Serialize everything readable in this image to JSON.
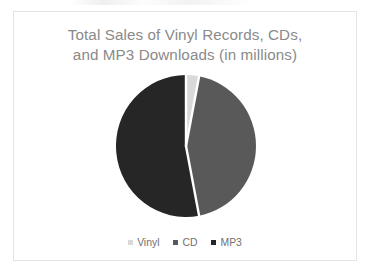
{
  "chart_data": {
    "type": "pie",
    "title": "Total Sales of Vinyl Records, CDs, and MP3 Downloads (in millions)",
    "title_lines": [
      "Total Sales of Vinyl Records, CDs,",
      "and MP3 Downloads (in millions)"
    ],
    "categories": [
      "Vinyl",
      "CD",
      "MP3"
    ],
    "values": [
      3,
      44,
      53
    ],
    "unit": "millions",
    "labels_shown": false,
    "legend_position": "bottom",
    "start_angle_deg": 0,
    "direction": "clockwise",
    "slices": [
      {
        "name": "Vinyl",
        "value": 3,
        "percent": 3,
        "color": "#d9d9d9",
        "start_deg": 0,
        "end_deg": 10.8
      },
      {
        "name": "CD",
        "value": 44,
        "percent": 44,
        "color": "#595959",
        "start_deg": 10.8,
        "end_deg": 169.2
      },
      {
        "name": "MP3",
        "value": 53,
        "percent": 53,
        "color": "#262626",
        "start_deg": 169.2,
        "end_deg": 360
      }
    ],
    "xlabel": "",
    "ylabel": ""
  },
  "chart": {
    "legend": [
      {
        "label": "Vinyl",
        "color": "#d9d9d9"
      },
      {
        "label": "CD",
        "color": "#595959"
      },
      {
        "label": "MP3",
        "color": "#262626"
      }
    ]
  },
  "colors": {
    "title_text": "#8a8a8a",
    "legend_text": "#6f6f6f",
    "frame_border": "#e4e4e4",
    "background": "#ffffff",
    "slice_separator": "#ffffff"
  }
}
